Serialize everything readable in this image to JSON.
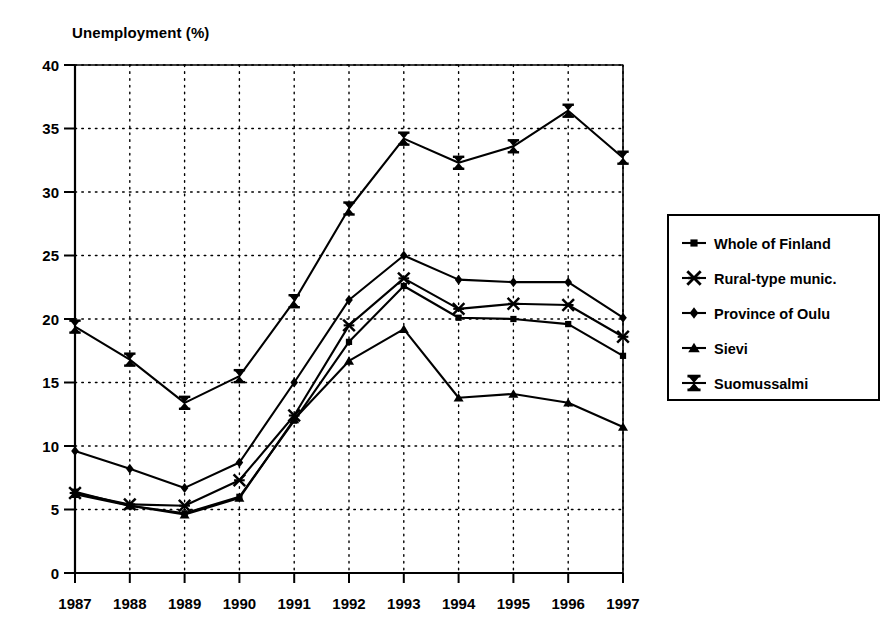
{
  "chart_data": {
    "type": "line",
    "title": "Unemployment (%)",
    "ylabel": "Unemployment (%)",
    "xlabel": "",
    "grid": true,
    "legend_position": "right",
    "ylim": [
      0,
      40
    ],
    "ytick_step": 5,
    "ytick_labels": [
      "0",
      "5",
      "10",
      "15",
      "20",
      "25",
      "30",
      "35",
      "40"
    ],
    "categories": [
      "1987",
      "1988",
      "1989",
      "1990",
      "1991",
      "1992",
      "1993",
      "1994",
      "1995",
      "1996",
      "1997"
    ],
    "series": [
      {
        "name": "Whole of Finland",
        "marker": "square",
        "values": [
          6.4,
          5.3,
          4.7,
          6.0,
          12.0,
          18.2,
          22.6,
          20.1,
          20.0,
          19.6,
          17.1
        ]
      },
      {
        "name": "Rural-type munic.",
        "marker": "asterisk",
        "values": [
          6.3,
          5.4,
          5.3,
          7.3,
          12.4,
          19.5,
          23.2,
          20.8,
          21.2,
          21.1,
          18.6
        ]
      },
      {
        "name": "Province of Oulu",
        "marker": "diamond",
        "values": [
          9.6,
          8.2,
          6.7,
          8.7,
          15.0,
          21.5,
          25.0,
          23.1,
          22.9,
          22.9,
          20.1
        ]
      },
      {
        "name": "Sievi",
        "marker": "triangle",
        "values": [
          6.2,
          5.3,
          4.6,
          5.9,
          12.1,
          16.7,
          19.2,
          13.8,
          14.1,
          13.4,
          11.5
        ]
      },
      {
        "name": "Suomussalmi",
        "marker": "star",
        "values": [
          19.4,
          16.8,
          13.4,
          15.5,
          21.4,
          28.7,
          34.2,
          32.3,
          33.6,
          36.4,
          32.7
        ]
      }
    ]
  },
  "legend": {
    "items": [
      {
        "label": "Whole of Finland",
        "marker": "square"
      },
      {
        "label": "Rural-type munic.",
        "marker": "asterisk"
      },
      {
        "label": "Province of Oulu",
        "marker": "diamond"
      },
      {
        "label": "Sievi",
        "marker": "triangle"
      },
      {
        "label": "Suomussalmi",
        "marker": "star"
      }
    ]
  },
  "colors": {
    "line": "#000000",
    "grid": "#000000",
    "axis": "#000000",
    "background": "#ffffff"
  }
}
